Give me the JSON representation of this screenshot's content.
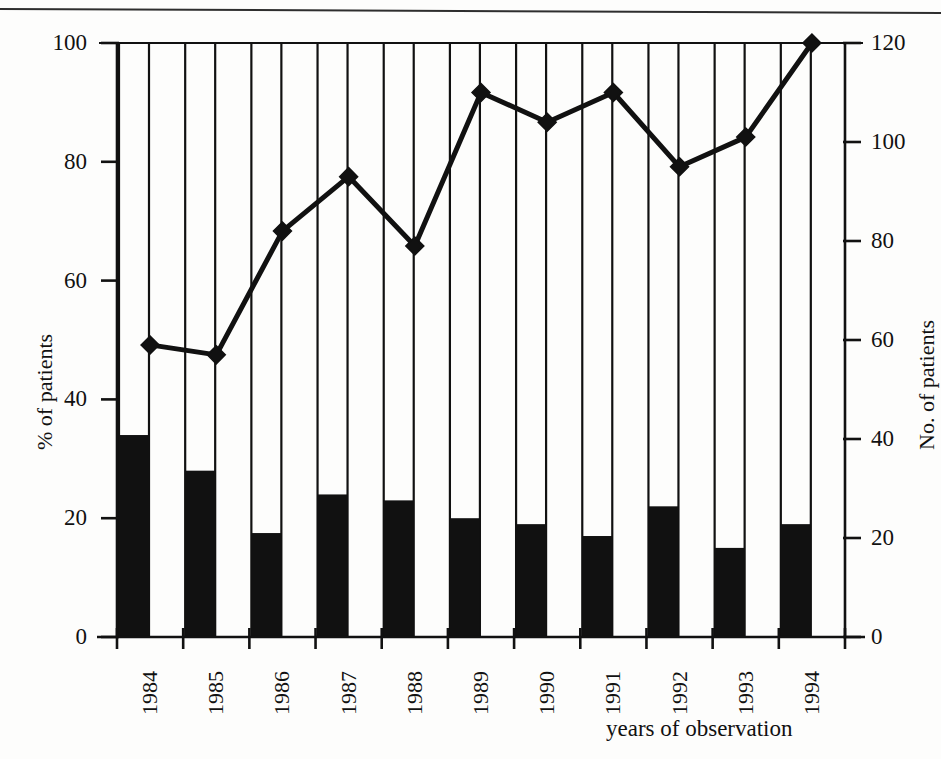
{
  "chart_data": {
    "type": "bar",
    "title": "",
    "subtitle": "",
    "xlabel": "years of observation",
    "categories": [
      "1984",
      "1985",
      "1986",
      "1987",
      "1988",
      "1989",
      "1990",
      "1991",
      "1992",
      "1993",
      "1994"
    ],
    "grid": true,
    "legend_position": "none",
    "annotations": [],
    "axes": {
      "left": {
        "label": "% of patients",
        "ticks": [
          "0",
          "20",
          "40",
          "60",
          "80",
          "100"
        ],
        "tick_values": [
          0,
          20,
          40,
          60,
          80,
          100
        ],
        "lim": [
          0,
          100
        ]
      },
      "right": {
        "label": "No. of patients",
        "ticks": [
          "0",
          "20",
          "40",
          "60",
          "80",
          "100",
          "120"
        ],
        "tick_values": [
          0,
          20,
          40,
          60,
          80,
          100,
          120
        ],
        "lim": [
          0,
          120
        ]
      },
      "x": {
        "label": "years of observation",
        "ticks": [
          "1984",
          "1985",
          "1986",
          "1987",
          "1988",
          "1989",
          "1990",
          "1991",
          "1992",
          "1993",
          "1994"
        ]
      }
    },
    "series": [
      {
        "name": "% of patients",
        "type": "bar",
        "axis": "left",
        "color": "#111111",
        "values": [
          34,
          28,
          17.5,
          24,
          23,
          20,
          19,
          17,
          22,
          15,
          19
        ]
      },
      {
        "name": "No. of patients",
        "type": "line",
        "axis": "right",
        "color": "#111111",
        "marker": "diamond",
        "values": [
          59,
          57,
          82,
          93,
          79,
          110,
          104,
          110,
          95,
          101,
          120
        ]
      }
    ]
  },
  "colors": {
    "ink": "#111111",
    "paper": "#fdfdfc",
    "bar_fill": "#111111",
    "line_stroke": "#111111"
  },
  "geometry": {
    "plot_left": 117,
    "plot_right": 845,
    "plot_top": 43,
    "plot_bottom": 637,
    "bar_width": 30,
    "slot_width": 64
  }
}
